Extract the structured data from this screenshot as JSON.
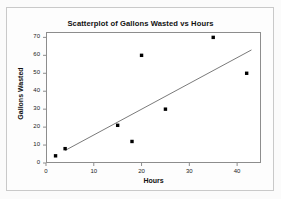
{
  "chart_data": {
    "type": "scatter",
    "title": "Scatterplot of Gallons Wasted vs Hours",
    "xlabel": "Hours",
    "ylabel": "Gallons Wasted",
    "xlim": [
      0,
      45
    ],
    "ylim": [
      0,
      73
    ],
    "xticks": [
      0,
      10,
      20,
      30,
      40
    ],
    "yticks": [
      0,
      10,
      20,
      30,
      40,
      50,
      60,
      70
    ],
    "grid": false,
    "legend": null,
    "marker": "filled-square",
    "marker_color": "#000000",
    "points": [
      {
        "x": 2,
        "y": 4
      },
      {
        "x": 4,
        "y": 8
      },
      {
        "x": 15,
        "y": 21
      },
      {
        "x": 18,
        "y": 12
      },
      {
        "x": 20,
        "y": 60
      },
      {
        "x": 25,
        "y": 30
      },
      {
        "x": 35,
        "y": 70
      },
      {
        "x": 42,
        "y": 50
      }
    ],
    "trendline": {
      "type": "linear-fit",
      "color": "#6b6b6b",
      "x_start": 4,
      "y_start": 7,
      "x_end": 43,
      "y_end": 63
    }
  }
}
